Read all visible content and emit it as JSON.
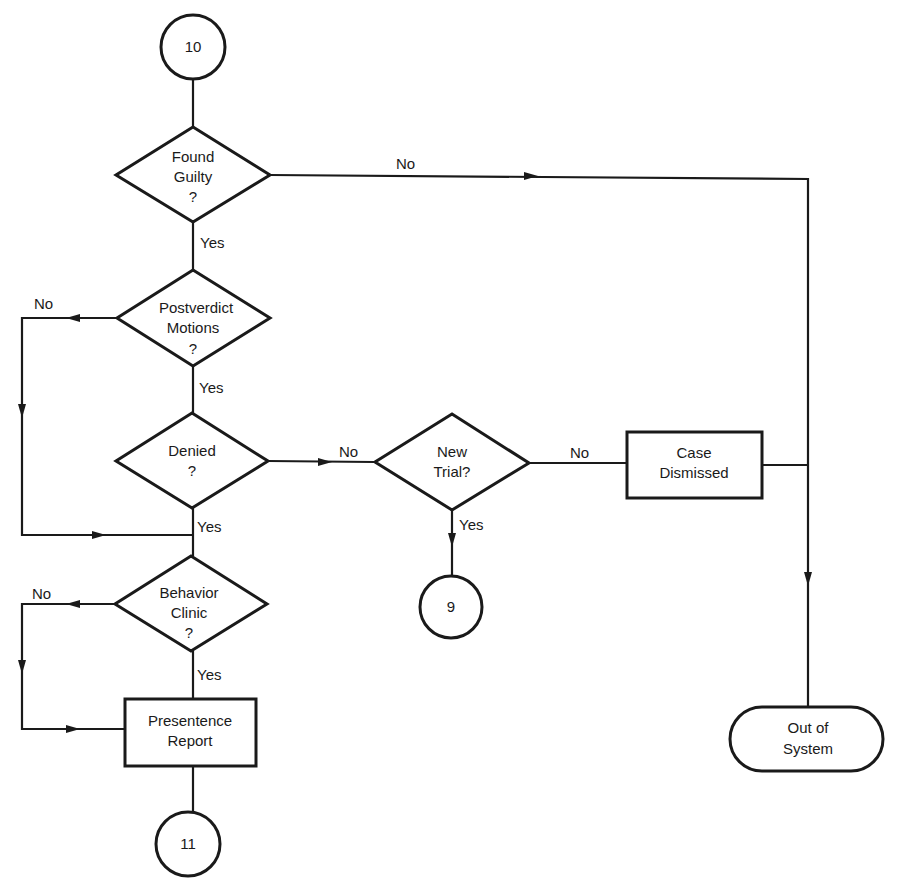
{
  "diagram": {
    "type": "flowchart",
    "colors": {
      "stroke": "#1a1a1a",
      "background": "#ffffff"
    },
    "nodes": {
      "c10": {
        "shape": "circle",
        "label": "10"
      },
      "found_guilty": {
        "shape": "diamond",
        "lines": [
          "Found",
          "Guilty",
          "?"
        ]
      },
      "postverdict": {
        "shape": "diamond",
        "lines": [
          "Postverdict",
          "Motions",
          "?"
        ]
      },
      "denied": {
        "shape": "diamond",
        "lines": [
          "Denied",
          "?"
        ]
      },
      "new_trial": {
        "shape": "diamond",
        "lines": [
          "New",
          "Trial?"
        ]
      },
      "case_dismissed": {
        "shape": "rectangle",
        "lines": [
          "Case",
          "Dismissed"
        ]
      },
      "c9": {
        "shape": "circle",
        "label": "9"
      },
      "behavior_clinic": {
        "shape": "diamond",
        "lines": [
          "Behavior",
          "Clinic",
          "?"
        ]
      },
      "presentence": {
        "shape": "rectangle",
        "lines": [
          "Presentence",
          "Report"
        ]
      },
      "c11": {
        "shape": "circle",
        "label": "11"
      },
      "out_of_system": {
        "shape": "terminator",
        "lines": [
          "Out of",
          "System"
        ]
      }
    },
    "edge_labels": {
      "found_guilty_no": "No",
      "found_guilty_yes": "Yes",
      "postverdict_no": "No",
      "postverdict_yes": "Yes",
      "denied_no": "No",
      "denied_yes": "Yes",
      "new_trial_no": "No",
      "new_trial_yes": "Yes",
      "behavior_no": "No",
      "behavior_yes": "Yes"
    },
    "edges": [
      {
        "from": "10",
        "to": "Found Guilty?"
      },
      {
        "from": "Found Guilty?",
        "to": "Out of System",
        "label": "No"
      },
      {
        "from": "Found Guilty?",
        "to": "Postverdict Motions?",
        "label": "Yes"
      },
      {
        "from": "Postverdict Motions?",
        "to": "Behavior Clinic?",
        "label": "No"
      },
      {
        "from": "Postverdict Motions?",
        "to": "Denied?",
        "label": "Yes"
      },
      {
        "from": "Denied?",
        "to": "New Trial?",
        "label": "No"
      },
      {
        "from": "Denied?",
        "to": "Behavior Clinic?",
        "label": "Yes"
      },
      {
        "from": "New Trial?",
        "to": "Case Dismissed",
        "label": "No"
      },
      {
        "from": "New Trial?",
        "to": "9",
        "label": "Yes"
      },
      {
        "from": "Case Dismissed",
        "to": "Out of System"
      },
      {
        "from": "Behavior Clinic?",
        "to": "Presentence Report",
        "label": "No"
      },
      {
        "from": "Behavior Clinic?",
        "to": "Presentence Report",
        "label": "Yes"
      },
      {
        "from": "Presentence Report",
        "to": "11"
      }
    ]
  }
}
